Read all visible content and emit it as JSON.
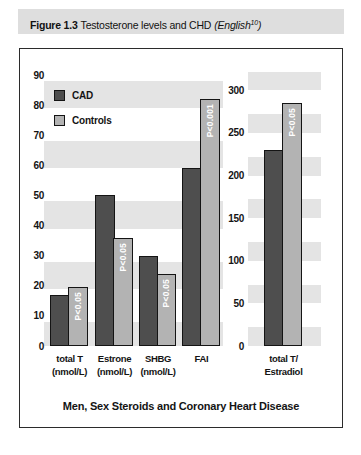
{
  "header": {
    "figure_label": "Figure 1.3",
    "title": "Testosterone levels and CHD",
    "ref": {
      "prefix": "(English",
      "sup": "10",
      "suffix": ")"
    }
  },
  "caption": "Men, Sex Steroids and Coronary Heart Disease",
  "legend": {
    "items": [
      {
        "name": "CAD",
        "color": "#4e4e4e"
      },
      {
        "name": "Controls",
        "color": "#b3b3b3"
      }
    ]
  },
  "colors": {
    "cad_bar": "#4e4e4e",
    "controls_bar": "#b3b3b3",
    "stripe": "#e4e4e4",
    "bar_border": "#141414",
    "p_label_text": "#ffffff",
    "header_bg": "#dedede"
  },
  "chart_data": [
    {
      "type": "bar",
      "title": "",
      "categories": [
        [
          "total T",
          "(nmol/L)"
        ],
        [
          "Estrone",
          "(nmol/L)"
        ],
        [
          "SHBG",
          "(nmol/L)"
        ],
        [
          "FAI"
        ]
      ],
      "series": [
        {
          "name": "CAD",
          "values": [
            17,
            50,
            30,
            59
          ]
        },
        {
          "name": "Controls",
          "values": [
            19.5,
            36,
            24,
            82
          ]
        }
      ],
      "p_labels": [
        "P<0.05",
        "P<0.05",
        "P<0.05",
        "P<0.001"
      ],
      "p_labels_on_series": "Controls",
      "xlabel": "",
      "ylabel": "",
      "ylim": [
        0,
        92
      ],
      "yticks": [
        0,
        10,
        20,
        30,
        40,
        50,
        60,
        70,
        80,
        90
      ],
      "grid": false,
      "background_stripes": [
        [
          0,
          8
        ],
        [
          19,
          28
        ],
        [
          39,
          48
        ],
        [
          59,
          68
        ],
        [
          79,
          88
        ]
      ],
      "legend_position": "top-left inside plot"
    },
    {
      "type": "bar",
      "title": "",
      "categories": [
        [
          "total T/",
          "Estradiol"
        ]
      ],
      "series": [
        {
          "name": "CAD",
          "values": [
            230
          ]
        },
        {
          "name": "Controls",
          "values": [
            285
          ]
        }
      ],
      "p_labels": [
        "P<0.05"
      ],
      "p_labels_on_series": "Controls",
      "xlabel": "",
      "ylabel": "",
      "ylim": [
        0,
        325
      ],
      "yticks": [
        0,
        50,
        100,
        150,
        200,
        250,
        300
      ],
      "grid": false,
      "background_stripes": [
        [
          0,
          22
        ],
        [
          50,
          72
        ],
        [
          100,
          122
        ],
        [
          150,
          172
        ],
        [
          200,
          222
        ],
        [
          250,
          272
        ],
        [
          300,
          322
        ]
      ],
      "legend_position": "none"
    }
  ]
}
